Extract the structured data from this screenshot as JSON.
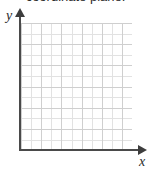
{
  "caption": {
    "text": "coordinate plane."
  },
  "figure": {
    "y_axis_label": "y",
    "x_axis_label": "x",
    "y_axis_arrow_icon": "arrow-up-icon",
    "x_axis_arrow_icon": "arrow-right-icon",
    "axis_color": "#4a4a4a",
    "grid_minor_color": "#e2e2e2",
    "grid_major_color": "#cfcfcf",
    "background_color": "#ffffff"
  },
  "chart_data": {
    "type": "scatter",
    "title": "coordinate plane.",
    "xlabel": "x",
    "ylabel": "y",
    "grid": true,
    "legend": null,
    "series": [],
    "x": [],
    "values": [],
    "xlim": [
      0,
      11
    ],
    "ylim": [
      0,
      12
    ],
    "x_tick_labels": [],
    "y_tick_labels": [],
    "grid_columns": 11,
    "grid_rows": 12,
    "annotations": []
  }
}
